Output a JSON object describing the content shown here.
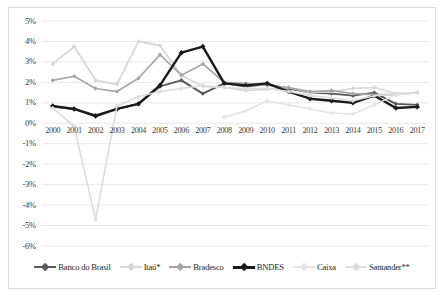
{
  "chart_data": {
    "type": "line",
    "title": "",
    "subtitle": "",
    "xlabel": "",
    "ylabel": "",
    "grid": true,
    "legend_position": "bottom",
    "ylim": [
      -6,
      5
    ],
    "ytick_step": 1,
    "ytick_labels": [
      "5%",
      "4%",
      "3%",
      "2%",
      "1%",
      "0%",
      "-1%",
      "-2%",
      "-3%",
      "-4%",
      "-5%",
      "-6%"
    ],
    "ytick_values": [
      5,
      4,
      3,
      2,
      1,
      0,
      -1,
      -2,
      -3,
      -4,
      -5,
      -6
    ],
    "axis_crosses_at": 0,
    "categories": [
      "2000",
      "2001",
      "2002",
      "2003",
      "2004",
      "2005",
      "2006",
      "2007",
      "2008",
      "2009",
      "2010",
      "2011",
      "2012",
      "2013",
      "2014",
      "2015",
      "2016",
      "2017"
    ],
    "x": [
      2000,
      2001,
      2002,
      2003,
      2004,
      2005,
      2006,
      2007,
      2008,
      2009,
      2010,
      2011,
      2012,
      2013,
      2014,
      2015,
      2016,
      2017
    ],
    "series": [
      {
        "name": "Banco do Brasil",
        "color": "#595959",
        "width": 1.9,
        "marker": "diamond",
        "values": [
          0.8,
          0.7,
          0.4,
          0.7,
          0.95,
          1.8,
          2.1,
          1.45,
          1.95,
          1.8,
          1.9,
          1.7,
          1.5,
          1.45,
          1.35,
          1.5,
          0.95,
          0.9
        ]
      },
      {
        "name": "Itaú*",
        "color": "#d6d6d6",
        "width": 1.7,
        "marker": "diamond",
        "values": [
          2.9,
          3.75,
          2.1,
          1.9,
          4.0,
          3.8,
          2.35,
          1.8,
          1.75,
          1.6,
          1.65,
          1.75,
          1.5,
          1.55,
          1.7,
          1.75,
          1.45,
          1.5
        ]
      },
      {
        "name": "Bradesco",
        "color": "#a6a6a6",
        "width": 1.7,
        "marker": "diamond",
        "values": [
          2.1,
          2.3,
          1.7,
          1.55,
          2.2,
          3.35,
          2.35,
          2.9,
          2.0,
          1.95,
          1.85,
          1.75,
          1.55,
          1.6,
          1.45,
          1.4,
          1.4,
          1.5
        ]
      },
      {
        "name": "BNDES",
        "color": "#1a1a1a",
        "width": 2.4,
        "marker": "diamond",
        "values": [
          0.85,
          0.7,
          0.35,
          0.7,
          0.95,
          1.85,
          3.45,
          3.75,
          1.95,
          1.85,
          1.95,
          1.55,
          1.2,
          1.1,
          1.0,
          1.35,
          0.75,
          0.8
        ]
      },
      {
        "name": "Caixa",
        "color": "#e3e3e3",
        "width": 1.6,
        "marker": "diamond",
        "values": [
          null,
          null,
          null,
          null,
          null,
          null,
          null,
          null,
          0.3,
          0.6,
          1.1,
          0.9,
          0.7,
          0.5,
          0.45,
          0.9,
          1.4,
          1.5
        ]
      },
      {
        "name": "Santander**",
        "color": "#dcdcdc",
        "width": 1.6,
        "marker": "diamond",
        "values": [
          0.75,
          -0.15,
          -4.7,
          0.85,
          1.3,
          1.55,
          1.7,
          1.85,
          1.75,
          1.7,
          1.7,
          1.55,
          1.35,
          1.25,
          1.1,
          1.35,
          1.45,
          1.5
        ]
      }
    ]
  },
  "legend": {
    "items": [
      {
        "label": "Banco do Brasil"
      },
      {
        "label": "Itaú*"
      },
      {
        "label": "Bradesco"
      },
      {
        "label": "BNDES"
      },
      {
        "label": "Caixa"
      },
      {
        "label": "Santander**"
      }
    ]
  },
  "colors": {
    "background": "#ffffff",
    "frame": "#d9d9d9",
    "gridline": "#e8e8e8",
    "axis_text": "#3a3a3a"
  }
}
